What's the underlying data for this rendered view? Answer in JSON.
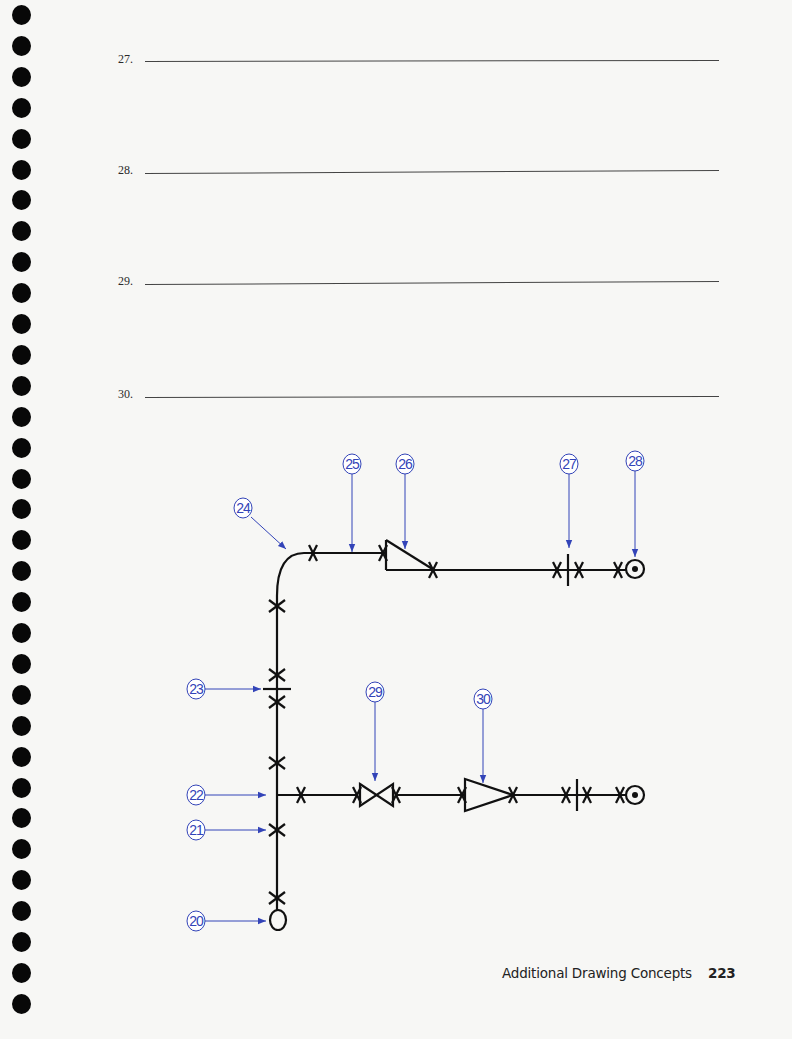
{
  "page": {
    "type": "workbook page",
    "binding_holes": 33
  },
  "questions": [
    {
      "number": "27.",
      "answer": ""
    },
    {
      "number": "28.",
      "answer": ""
    },
    {
      "number": "29.",
      "answer": ""
    },
    {
      "number": "30.",
      "answer": ""
    }
  ],
  "drawing": {
    "title": "Single-line piping isometric with callouts",
    "colors": {
      "pipe": "#111111",
      "callout": "#3344b8"
    },
    "callouts": [
      {
        "id": "20",
        "label": "20",
        "points_to": "elbow turned down"
      },
      {
        "id": "21",
        "label": "21",
        "points_to": "welded joint"
      },
      {
        "id": "22",
        "label": "22",
        "points_to": "tee"
      },
      {
        "id": "23",
        "label": "23",
        "points_to": "flanged joint"
      },
      {
        "id": "24",
        "label": "24",
        "points_to": "elbow"
      },
      {
        "id": "25",
        "label": "25",
        "points_to": "pipe"
      },
      {
        "id": "26",
        "label": "26",
        "points_to": "eccentric reducer"
      },
      {
        "id": "27",
        "label": "27",
        "points_to": "flanged joint"
      },
      {
        "id": "28",
        "label": "28",
        "points_to": "elbow turned up"
      },
      {
        "id": "29",
        "label": "29",
        "points_to": "gate valve"
      },
      {
        "id": "30",
        "label": "30",
        "points_to": "concentric reducer"
      }
    ]
  },
  "footer": {
    "section": "Additional Drawing Concepts",
    "page_number": "223"
  }
}
